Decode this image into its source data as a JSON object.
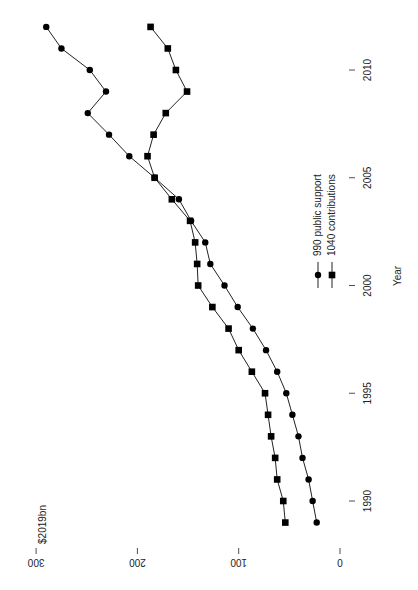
{
  "chart_data": {
    "type": "line",
    "title": "",
    "xlabel": "Year",
    "ylabel": "$2019bn",
    "orientation": "rotated-90-clockwise",
    "x": [
      1989,
      1990,
      1991,
      1992,
      1993,
      1994,
      1995,
      1996,
      1997,
      1998,
      1999,
      2000,
      2001,
      2002,
      2003,
      2004,
      2005,
      2006,
      2007,
      2008,
      2009,
      2010,
      2011,
      2012
    ],
    "xticks": [
      1990,
      1995,
      2000,
      2005,
      2010
    ],
    "yticks": [
      0,
      100,
      200,
      300
    ],
    "ylim": [
      0,
      300
    ],
    "grid": false,
    "legend_position": "lower-right (rotated)",
    "series": [
      {
        "name": "990 public support",
        "marker": "circle",
        "values": [
          23,
          27,
          31,
          37,
          41,
          47,
          53,
          62,
          73,
          86,
          101,
          114,
          128,
          133,
          147,
          159,
          183,
          208,
          228,
          249,
          231,
          247,
          275,
          290
        ]
      },
      {
        "name": "1040 contributions",
        "marker": "square",
        "values": [
          54,
          56,
          62,
          64,
          68,
          71,
          74,
          87,
          100,
          110,
          126,
          140,
          141,
          143,
          148,
          166,
          183,
          190,
          184,
          172,
          151,
          162,
          170,
          187
        ]
      }
    ]
  }
}
